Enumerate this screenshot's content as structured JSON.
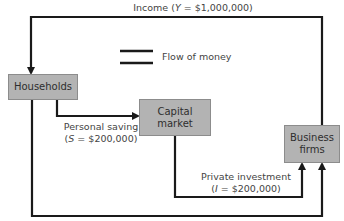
{
  "diagram": {
    "nodes": {
      "households": {
        "label": "Households"
      },
      "capital_market": {
        "label_line1": "Capital",
        "label_line2": "market"
      },
      "business_firms": {
        "label_line1": "Business",
        "label_line2": "firms"
      }
    },
    "flows": {
      "income": {
        "prefix": "Income (",
        "var": "Y",
        "suffix": " = $1,000,000)"
      },
      "personal_saving": {
        "line1": "Personal saving",
        "prefix": "(",
        "var": "S",
        "suffix": " = $200,000)"
      },
      "private_investment": {
        "line1": "Private investment",
        "prefix": "(",
        "var": "I",
        "suffix": " = $200,000)"
      }
    },
    "legend": {
      "label": "Flow of money"
    },
    "colors": {
      "line": "#1a1a1a",
      "box_fill": "#b3b3b3",
      "box_border": "#8c8c8c",
      "text": "#444444"
    }
  }
}
